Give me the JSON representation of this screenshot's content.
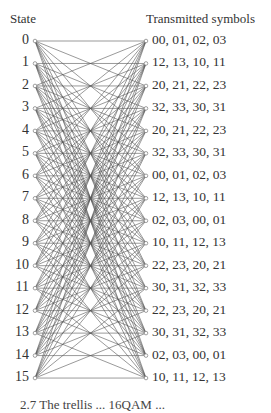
{
  "diagram": {
    "type": "trellis",
    "left_header": "State",
    "right_header": "Transmitted symbols",
    "states": [
      "0",
      "1",
      "2",
      "3",
      "4",
      "5",
      "6",
      "7",
      "8",
      "9",
      "10",
      "11",
      "12",
      "13",
      "14",
      "15"
    ],
    "symbols": [
      "00, 01, 02, 03",
      "12, 13, 10, 11",
      "20, 21, 22, 23",
      "32, 33, 30, 31",
      "20, 21, 22, 23",
      "32, 33, 30, 31",
      "00, 01, 02, 03",
      "12, 13, 10, 11",
      "02, 03, 00, 01",
      "10, 11, 12, 13",
      "22, 23, 20, 21",
      "30, 31, 32, 33",
      "22, 23, 20, 21",
      "30, 31, 32, 33",
      "02, 03, 00, 01",
      "10, 11, 12, 13"
    ],
    "caption": "2.7  The trellis ... 16QAM ..."
  },
  "colors": {
    "line": "#555555",
    "text": "#333333",
    "node": "#888888"
  }
}
